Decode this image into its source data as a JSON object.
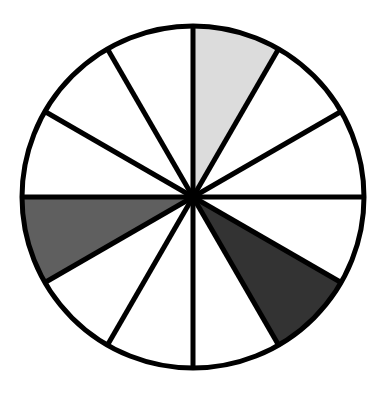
{
  "diagram": {
    "type": "fraction-circle",
    "center": {
      "x": 193,
      "y": 197
    },
    "radius": 171,
    "stroke_color": "#000000",
    "outline_width": 5,
    "divider_width": 5,
    "total_slices": 12,
    "start_angle_deg": 0,
    "background_fill": "#ffffff",
    "slices": [
      {
        "index": 0,
        "fill": "#dcdcdc",
        "shaded": true,
        "shade": "light"
      },
      {
        "index": 1,
        "fill": "#ffffff",
        "shaded": false
      },
      {
        "index": 2,
        "fill": "#ffffff",
        "shaded": false
      },
      {
        "index": 3,
        "fill": "#ffffff",
        "shaded": false
      },
      {
        "index": 4,
        "fill": "#333333",
        "shaded": true,
        "shade": "dark"
      },
      {
        "index": 5,
        "fill": "#ffffff",
        "shaded": false
      },
      {
        "index": 6,
        "fill": "#ffffff",
        "shaded": false
      },
      {
        "index": 7,
        "fill": "#ffffff",
        "shaded": false
      },
      {
        "index": 8,
        "fill": "#5f5f5f",
        "shaded": true,
        "shade": "medium"
      },
      {
        "index": 9,
        "fill": "#ffffff",
        "shaded": false
      },
      {
        "index": 10,
        "fill": "#ffffff",
        "shaded": false
      },
      {
        "index": 11,
        "fill": "#ffffff",
        "shaded": false
      }
    ],
    "shaded_count": 3
  }
}
